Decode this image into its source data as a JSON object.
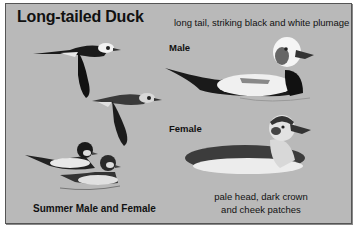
{
  "plate": {
    "title": "Long-tailed Duck",
    "subtitle": "long tail, striking black and white plumage",
    "labels": {
      "male": "Male",
      "female": "Female",
      "summer": "Summer Male and Female",
      "female_description_line1": "pale head, dark crown",
      "female_description_line2": "and cheek patches"
    },
    "illustrations": [
      "flying-male-duck",
      "flying-female-duck",
      "swimming-male-duck-winter",
      "swimming-female-duck-winter",
      "swimming-male-duck-summer",
      "swimming-female-duck-summer"
    ],
    "colors": {
      "background": "#b9b9b9",
      "border": "#555555",
      "text": "#111111"
    }
  }
}
